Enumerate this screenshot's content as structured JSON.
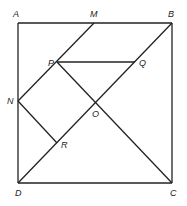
{
  "diagram": {
    "colors": {
      "line": "#222222",
      "label": "#222222",
      "background": "#ffffff"
    },
    "points": {
      "A": {
        "label": "A",
        "x": 18,
        "y": 23
      },
      "M": {
        "label": "M",
        "x": 94,
        "y": 23
      },
      "B": {
        "label": "B",
        "x": 172,
        "y": 23
      },
      "N": {
        "label": "N",
        "x": 18,
        "y": 101
      },
      "P": {
        "label": "P",
        "x": 57,
        "y": 62
      },
      "Q": {
        "label": "Q",
        "x": 135,
        "y": 62
      },
      "O": {
        "label": "O",
        "x": 95,
        "y": 104
      },
      "R": {
        "label": "R",
        "x": 57,
        "y": 143
      },
      "D": {
        "label": "D",
        "x": 18,
        "y": 183
      },
      "C": {
        "label": "C",
        "x": 172,
        "y": 183
      }
    },
    "segments": [
      [
        "A",
        "B"
      ],
      [
        "B",
        "C"
      ],
      [
        "C",
        "D"
      ],
      [
        "D",
        "A"
      ],
      [
        "D",
        "B"
      ],
      [
        "M",
        "N"
      ],
      [
        "P",
        "Q"
      ],
      [
        "P",
        "C"
      ],
      [
        "N",
        "R"
      ]
    ]
  }
}
